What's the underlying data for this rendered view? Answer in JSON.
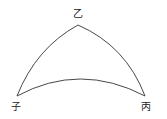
{
  "diagram": {
    "type": "spherical-triangle",
    "stroke_color": "#333333",
    "vertices": [
      {
        "id": "top",
        "label": "乙",
        "x": 78,
        "y": 25
      },
      {
        "id": "left",
        "label": "子",
        "x": 17,
        "y": 96
      },
      {
        "id": "right",
        "label": "丙",
        "x": 145,
        "y": 96
      }
    ],
    "labels": {
      "top": "乙",
      "left": "子",
      "right": "丙"
    }
  }
}
